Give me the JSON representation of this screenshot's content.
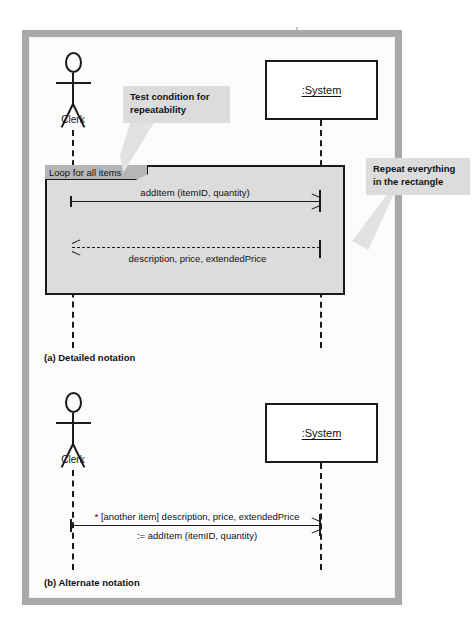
{
  "figure": {
    "type": "uml-sequence-diagram",
    "panels": [
      {
        "id": "a",
        "caption": "(a) Detailed notation",
        "actor": {
          "name": "Clerk",
          "icon": "stick-figure-actor-icon"
        },
        "object": {
          "name": ":System"
        },
        "frame": {
          "kind": "loop",
          "tab_label": "Loop for all items"
        },
        "messages": [
          {
            "id": "m1",
            "label": "addItem (itemID, quantity)",
            "direction": "right",
            "style": "solid",
            "from": "Clerk",
            "to": ":System"
          },
          {
            "id": "m2",
            "label": "description, price, extendedPrice",
            "direction": "left",
            "style": "dashed",
            "from": ":System",
            "to": "Clerk"
          }
        ],
        "callouts": [
          {
            "id": "c1",
            "lines": [
              "Test condition for",
              "repeatability"
            ],
            "points_to": "loop-frame-tab"
          },
          {
            "id": "c2",
            "lines": [
              "Repeat everything",
              "in the rectangle"
            ],
            "points_to": "loop-frame-body"
          }
        ]
      },
      {
        "id": "b",
        "caption": "(b) Alternate notation",
        "actor": {
          "name": "Clerk",
          "icon": "stick-figure-actor-icon"
        },
        "object": {
          "name": ":System"
        },
        "messages": [
          {
            "id": "m3",
            "label_line1": "* [another item] description, price, extendedPrice",
            "label_line2": ":= addItem (itemID, quantity)",
            "direction": "right",
            "style": "solid",
            "from": "Clerk",
            "to": ":System"
          }
        ]
      }
    ],
    "colors": {
      "page_border": "#a9a9a9",
      "page_background": "#fbfbfb",
      "loop_frame_fill": "#dcdcdc",
      "loop_tab_fill": "#b6b6b6",
      "callout_fill": "#dcdcdc",
      "ink": "#1a1a1a"
    }
  }
}
